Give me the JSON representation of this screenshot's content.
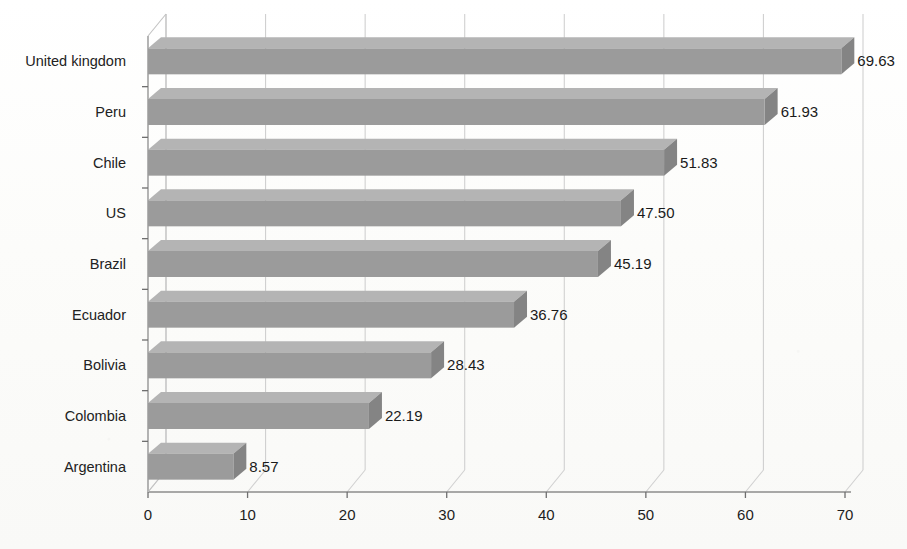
{
  "chart_data": {
    "type": "bar",
    "orientation": "horizontal",
    "title": "",
    "xlabel": "",
    "ylabel": "",
    "xlim": [
      0,
      70
    ],
    "xticks": [
      0,
      10,
      20,
      30,
      40,
      50,
      60,
      70
    ],
    "xtick_labels": [
      "0",
      "10",
      "20",
      "30",
      "40",
      "50",
      "60",
      "70"
    ],
    "grid": true,
    "grid_axis": "x",
    "legend": false,
    "style": "3d-bar",
    "categories": [
      "United kingdom",
      "Peru",
      "Chile",
      "US",
      "Brazil",
      "Ecuador",
      "Bolivia",
      "Colombia",
      "Argentina"
    ],
    "values": [
      69.63,
      61.93,
      51.83,
      47.5,
      45.19,
      36.76,
      28.43,
      22.19,
      8.57
    ],
    "data_labels": [
      "69.63",
      "61.93",
      "51.83",
      "47.50",
      "45.19",
      "36.76",
      "28.43",
      "22.19",
      "8.57"
    ],
    "colors": {
      "bar_front": "#9b9b9b",
      "bar_top": "#b4b4b4",
      "bar_side": "#848484",
      "gridline": "#d0d0d0",
      "axis": "#8d8d8d",
      "background": "#fdfdfb",
      "text": "#1a1a1a"
    }
  }
}
